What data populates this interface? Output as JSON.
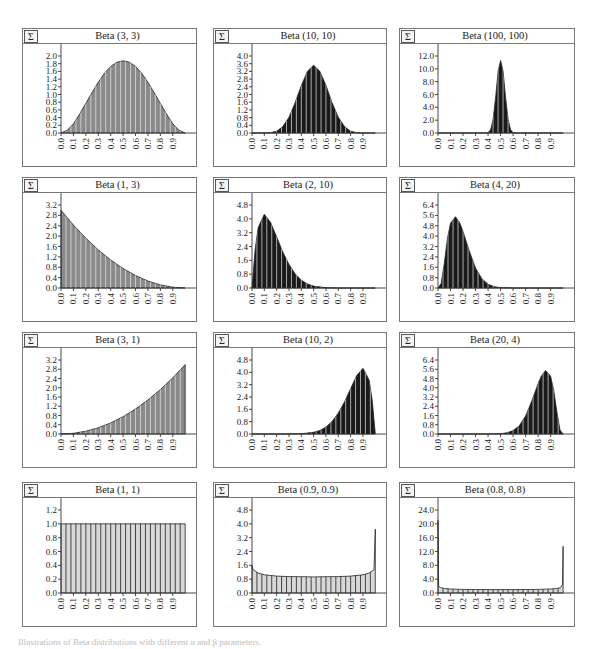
{
  "figure": {
    "caption": "Illustrations of Beta distributions with different α and β parameters.",
    "sigma_icon": "Σ",
    "colors": {
      "fill_light": "#d8d8d8",
      "fill_mid": "#8a8a8a",
      "fill_dark": "#1a1a1a",
      "stripe": "#ffffff",
      "axis": "#333333",
      "border": "#777777"
    }
  },
  "chart_data": [
    {
      "type": "area",
      "title": "Beta (3, 3)",
      "alpha": 3,
      "beta": 3,
      "xlabel": "",
      "ylabel": "",
      "x_ticks": [
        "0.0",
        "0.1",
        "0.2",
        "0.3",
        "0.4",
        "0.5",
        "0.6",
        "0.7",
        "0.8",
        "0.9"
      ],
      "y_ticks": [
        "0.0",
        "0.2",
        "0.4",
        "0.6",
        "0.8",
        "1.0",
        "1.2",
        "1.4",
        "1.6",
        "1.8",
        "2.0"
      ],
      "ylim": [
        0,
        2.0
      ],
      "peak": {
        "x": 0.5,
        "y": 1.875
      },
      "shade": "mid",
      "x": [
        0.0,
        0.05,
        0.1,
        0.15,
        0.2,
        0.25,
        0.3,
        0.35,
        0.4,
        0.45,
        0.5,
        0.55,
        0.6,
        0.65,
        0.7,
        0.75,
        0.8,
        0.85,
        0.9,
        0.95,
        1.0
      ],
      "values": [
        0,
        0.07,
        0.24,
        0.49,
        0.77,
        1.05,
        1.32,
        1.55,
        1.73,
        1.84,
        1.875,
        1.84,
        1.73,
        1.55,
        1.32,
        1.05,
        0.77,
        0.49,
        0.24,
        0.07,
        0
      ]
    },
    {
      "type": "area",
      "title": "Beta (10, 10)",
      "alpha": 10,
      "beta": 10,
      "xlabel": "",
      "ylabel": "",
      "x_ticks": [
        "0.0",
        "0.1",
        "0.2",
        "0.3",
        "0.4",
        "0.5",
        "0.6",
        "0.7",
        "0.8",
        "0.9"
      ],
      "y_ticks": [
        "0.0",
        "0.4",
        "0.8",
        "1.2",
        "1.6",
        "2.0",
        "2.4",
        "2.8",
        "3.2",
        "3.6",
        "4.0"
      ],
      "ylim": [
        0,
        4.0
      ],
      "peak": {
        "x": 0.5,
        "y": 3.52
      },
      "shade": "dark",
      "x": [
        0.0,
        0.1,
        0.15,
        0.2,
        0.25,
        0.3,
        0.35,
        0.4,
        0.45,
        0.5,
        0.55,
        0.6,
        0.65,
        0.7,
        0.75,
        0.8,
        0.85,
        0.9,
        1.0
      ],
      "values": [
        0,
        0.0,
        0.02,
        0.09,
        0.34,
        0.82,
        1.57,
        2.46,
        3.21,
        3.52,
        3.21,
        2.46,
        1.57,
        0.82,
        0.34,
        0.09,
        0.02,
        0.0,
        0
      ]
    },
    {
      "type": "area",
      "title": "Beta (100, 100)",
      "alpha": 100,
      "beta": 100,
      "xlabel": "",
      "ylabel": "",
      "x_ticks": [
        "0.0",
        "0.1",
        "0.2",
        "0.3",
        "0.4",
        "0.5",
        "0.6",
        "0.7",
        "0.8",
        "0.9"
      ],
      "y_ticks": [
        "0.0",
        "2.0",
        "4.0",
        "6.0",
        "8.0",
        "10.0",
        "12.0"
      ],
      "ylim": [
        0,
        12.0
      ],
      "peak": {
        "x": 0.5,
        "y": 11.3
      },
      "shade": "dark",
      "x": [
        0.0,
        0.38,
        0.4,
        0.42,
        0.44,
        0.46,
        0.48,
        0.5,
        0.52,
        0.54,
        0.56,
        0.58,
        0.6,
        0.62,
        1.0
      ],
      "values": [
        0,
        0,
        0.07,
        0.5,
        2.1,
        5.5,
        9.6,
        11.3,
        9.6,
        5.5,
        2.1,
        0.5,
        0.07,
        0,
        0
      ]
    },
    {
      "type": "area",
      "title": "Beta (1, 3)",
      "alpha": 1,
      "beta": 3,
      "xlabel": "",
      "ylabel": "",
      "x_ticks": [
        "0.0",
        "0.1",
        "0.2",
        "0.3",
        "0.4",
        "0.5",
        "0.6",
        "0.7",
        "0.8",
        "0.9"
      ],
      "y_ticks": [
        "0.0",
        "0.4",
        "0.8",
        "1.2",
        "1.6",
        "2.0",
        "2.4",
        "2.8",
        "3.2"
      ],
      "ylim": [
        0,
        3.2
      ],
      "peak": {
        "x": 0.0,
        "y": 3.0
      },
      "shade": "mid",
      "x": [
        0.0,
        0.1,
        0.2,
        0.3,
        0.4,
        0.5,
        0.6,
        0.7,
        0.8,
        0.9,
        1.0
      ],
      "values": [
        3.0,
        2.43,
        1.92,
        1.47,
        1.08,
        0.75,
        0.48,
        0.27,
        0.12,
        0.03,
        0
      ]
    },
    {
      "type": "area",
      "title": "Beta (2, 10)",
      "alpha": 2,
      "beta": 10,
      "xlabel": "",
      "ylabel": "",
      "x_ticks": [
        "0.0",
        "0.1",
        "0.2",
        "0.3",
        "0.4",
        "0.5",
        "0.6",
        "0.7",
        "0.8",
        "0.9"
      ],
      "y_ticks": [
        "0.0",
        "0.8",
        "1.6",
        "2.4",
        "3.2",
        "4.0",
        "4.8"
      ],
      "ylim": [
        0,
        4.8
      ],
      "peak": {
        "x": 0.1,
        "y": 4.26
      },
      "shade": "dark",
      "x": [
        0.0,
        0.025,
        0.05,
        0.1,
        0.15,
        0.2,
        0.25,
        0.3,
        0.35,
        0.4,
        0.45,
        0.5,
        0.6,
        0.7,
        0.8,
        1.0
      ],
      "values": [
        0,
        2.2,
        3.5,
        4.26,
        3.8,
        2.95,
        2.08,
        1.36,
        0.82,
        0.45,
        0.23,
        0.11,
        0.02,
        0.0,
        0,
        0
      ]
    },
    {
      "type": "area",
      "title": "Beta (4, 20)",
      "alpha": 4,
      "beta": 20,
      "xlabel": "",
      "ylabel": "",
      "x_ticks": [
        "0.0",
        "0.1",
        "0.2",
        "0.3",
        "0.4",
        "0.5",
        "0.6",
        "0.7",
        "0.8",
        "0.9"
      ],
      "y_ticks": [
        "0.0",
        "0.8",
        "1.6",
        "2.4",
        "3.2",
        "4.0",
        "4.8",
        "5.6",
        "6.4"
      ],
      "ylim": [
        0,
        6.4
      ],
      "peak": {
        "x": 0.14,
        "y": 5.5
      },
      "shade": "dark",
      "x": [
        0.0,
        0.025,
        0.05,
        0.075,
        0.1,
        0.14,
        0.175,
        0.2,
        0.25,
        0.3,
        0.35,
        0.4,
        0.45,
        0.5,
        0.6,
        1.0
      ],
      "values": [
        0,
        0.35,
        1.9,
        3.8,
        5.0,
        5.5,
        5.0,
        4.35,
        2.85,
        1.55,
        0.72,
        0.29,
        0.1,
        0.03,
        0,
        0
      ]
    },
    {
      "type": "area",
      "title": "Beta (3, 1)",
      "alpha": 3,
      "beta": 1,
      "xlabel": "",
      "ylabel": "",
      "x_ticks": [
        "0.0",
        "0.1",
        "0.2",
        "0.3",
        "0.4",
        "0.5",
        "0.6",
        "0.7",
        "0.8",
        "0.9"
      ],
      "y_ticks": [
        "0.0",
        "0.4",
        "0.8",
        "1.2",
        "1.6",
        "2.0",
        "2.4",
        "2.8",
        "3.2"
      ],
      "ylim": [
        0,
        3.2
      ],
      "peak": {
        "x": 1.0,
        "y": 3.0
      },
      "shade": "mid",
      "x": [
        0.0,
        0.1,
        0.2,
        0.3,
        0.4,
        0.5,
        0.6,
        0.7,
        0.8,
        0.9,
        1.0
      ],
      "values": [
        0,
        0.03,
        0.12,
        0.27,
        0.48,
        0.75,
        1.08,
        1.47,
        1.92,
        2.43,
        3.0
      ]
    },
    {
      "type": "area",
      "title": "Beta (10, 2)",
      "alpha": 10,
      "beta": 2,
      "xlabel": "",
      "ylabel": "",
      "x_ticks": [
        "0.0",
        "0.1",
        "0.2",
        "0.3",
        "0.4",
        "0.5",
        "0.6",
        "0.7",
        "0.8",
        "0.9"
      ],
      "y_ticks": [
        "0.0",
        "0.8",
        "1.6",
        "2.4",
        "3.2",
        "4.0",
        "4.8"
      ],
      "ylim": [
        0,
        4.8
      ],
      "peak": {
        "x": 0.9,
        "y": 4.26
      },
      "shade": "dark",
      "x": [
        0.0,
        0.2,
        0.4,
        0.5,
        0.55,
        0.6,
        0.65,
        0.7,
        0.75,
        0.8,
        0.85,
        0.9,
        0.95,
        0.975,
        1.0
      ],
      "values": [
        0,
        0,
        0.02,
        0.11,
        0.23,
        0.45,
        0.82,
        1.36,
        2.08,
        2.95,
        3.8,
        4.26,
        3.5,
        2.2,
        0
      ]
    },
    {
      "type": "area",
      "title": "Beta (20, 4)",
      "alpha": 20,
      "beta": 4,
      "xlabel": "",
      "ylabel": "",
      "x_ticks": [
        "0.0",
        "0.1",
        "0.2",
        "0.3",
        "0.4",
        "0.5",
        "0.6",
        "0.7",
        "0.8",
        "0.9"
      ],
      "y_ticks": [
        "0.0",
        "0.8",
        "1.6",
        "2.4",
        "3.2",
        "4.0",
        "4.8",
        "5.6",
        "6.4"
      ],
      "ylim": [
        0,
        6.4
      ],
      "peak": {
        "x": 0.86,
        "y": 5.5
      },
      "shade": "dark",
      "x": [
        0.0,
        0.4,
        0.5,
        0.55,
        0.6,
        0.65,
        0.7,
        0.75,
        0.8,
        0.825,
        0.86,
        0.9,
        0.925,
        0.95,
        0.975,
        1.0
      ],
      "values": [
        0,
        0,
        0.03,
        0.1,
        0.29,
        0.72,
        1.55,
        2.85,
        4.35,
        5.0,
        5.5,
        5.0,
        3.8,
        1.9,
        0.35,
        0
      ]
    },
    {
      "type": "bar",
      "title": "Beta (1, 1)",
      "alpha": 1,
      "beta": 1,
      "xlabel": "",
      "ylabel": "",
      "x_ticks": [
        "0.0",
        "0.1",
        "0.2",
        "0.3",
        "0.4",
        "0.5",
        "0.6",
        "0.7",
        "0.8",
        "0.9"
      ],
      "y_ticks": [
        "0.0",
        "0.2",
        "0.4",
        "0.6",
        "0.8",
        "1.0",
        "1.2"
      ],
      "ylim": [
        0,
        1.2
      ],
      "peak": {
        "x": 0.5,
        "y": 1.0
      },
      "shade": "light",
      "x": [
        0.0,
        1.0
      ],
      "values": [
        1.0,
        1.0
      ]
    },
    {
      "type": "bar",
      "title": "Beta (0.9, 0.9)",
      "alpha": 0.9,
      "beta": 0.9,
      "xlabel": "",
      "ylabel": "",
      "x_ticks": [
        "0.0",
        "0.1",
        "0.2",
        "0.3",
        "0.4",
        "0.5",
        "0.6",
        "0.7",
        "0.8",
        "0.9"
      ],
      "y_ticks": [
        "0.0",
        "0.8",
        "1.6",
        "2.4",
        "3.2",
        "4.0",
        "4.8"
      ],
      "ylim": [
        0,
        4.8
      ],
      "peak": {
        "x": 1.0,
        "y": 3.7
      },
      "shade": "light",
      "x": [
        0.0,
        0.01,
        0.05,
        0.1,
        0.2,
        0.3,
        0.4,
        0.5,
        0.6,
        0.7,
        0.8,
        0.9,
        0.95,
        0.99,
        1.0
      ],
      "values": [
        1.6,
        1.35,
        1.15,
        1.05,
        0.98,
        0.95,
        0.94,
        0.93,
        0.94,
        0.95,
        0.98,
        1.05,
        1.15,
        1.35,
        3.7
      ]
    },
    {
      "type": "bar",
      "title": "Beta (0.8, 0.8)",
      "alpha": 0.8,
      "beta": 0.8,
      "xlabel": "",
      "ylabel": "",
      "x_ticks": [
        "0.0",
        "0.1",
        "0.2",
        "0.3",
        "0.4",
        "0.5",
        "0.6",
        "0.7",
        "0.8",
        "0.9"
      ],
      "y_ticks": [
        "0.0",
        "4.0",
        "8.0",
        "12.0",
        "16.0",
        "20.0",
        "24.0"
      ],
      "ylim": [
        0,
        24.0
      ],
      "peak": {
        "x": 0.0,
        "y": 21.0
      },
      "shade": "light",
      "x": [
        0.0,
        0.005,
        0.02,
        0.05,
        0.1,
        0.2,
        0.3,
        0.4,
        0.5,
        0.6,
        0.7,
        0.8,
        0.9,
        0.95,
        0.98,
        0.995,
        1.0
      ],
      "values": [
        21.0,
        2.0,
        1.6,
        1.3,
        1.15,
        1.05,
        1.0,
        0.98,
        0.97,
        0.98,
        1.0,
        1.05,
        1.15,
        1.3,
        1.6,
        2.5,
        13.5
      ]
    }
  ]
}
